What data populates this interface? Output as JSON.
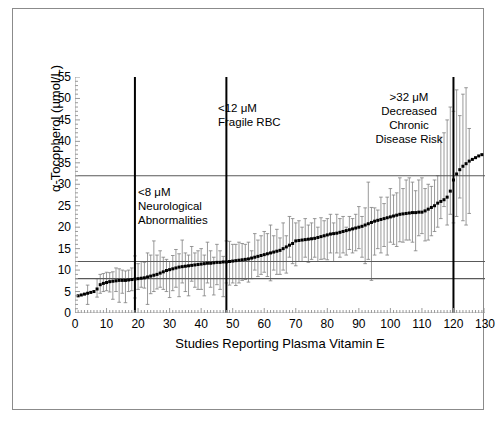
{
  "figure": {
    "caption": "",
    "background": "#ffffff",
    "frame_color": "#8b8b8b"
  },
  "colors": {
    "marker": "#000000",
    "errorbar": "#808080",
    "reference_line": "#595959",
    "divider_line": "#000000",
    "axis": "#9a9a9a",
    "text": "#000000"
  },
  "annotations": [
    {
      "id": "neurological",
      "text": "<8 μM\nNeurological\nAbnormalities",
      "at_x": 19
    },
    {
      "id": "fragile-rbc",
      "text": "<12 μM\nFragile RBC",
      "at_x": 48
    },
    {
      "id": "chronic-disease",
      "text": ">32 μM\nDecreased\nChronic\nDisease Risk",
      "at_x": 120
    }
  ],
  "chart_data": {
    "type": "scatter",
    "title": "",
    "xlabel": "Studies Reporting Plasma Vitamin E",
    "ylabel": "α-Tocopherol (μmol/L)",
    "xlim": [
      0,
      130
    ],
    "ylim": [
      0,
      55
    ],
    "xticks": [
      0,
      10,
      20,
      30,
      40,
      50,
      60,
      70,
      80,
      90,
      100,
      110,
      120,
      130
    ],
    "yticks": [
      0,
      5,
      10,
      15,
      20,
      25,
      30,
      35,
      40,
      45,
      50,
      55
    ],
    "grid": false,
    "legend": "none",
    "marker_style": "filled-square-with-error-bars",
    "reference_lines_y": [
      8,
      12,
      32
    ],
    "divider_lines_x": [
      19,
      48,
      120
    ],
    "x": [
      1,
      2,
      3,
      4,
      5,
      6,
      7,
      8,
      9,
      10,
      11,
      12,
      13,
      14,
      15,
      16,
      17,
      18,
      19,
      20,
      21,
      22,
      23,
      24,
      25,
      26,
      27,
      28,
      29,
      30,
      31,
      32,
      33,
      34,
      35,
      36,
      37,
      38,
      39,
      40,
      41,
      42,
      43,
      44,
      45,
      46,
      47,
      48,
      49,
      50,
      51,
      52,
      53,
      54,
      55,
      56,
      57,
      58,
      59,
      60,
      61,
      62,
      63,
      64,
      65,
      66,
      67,
      68,
      69,
      70,
      71,
      72,
      73,
      74,
      75,
      76,
      77,
      78,
      79,
      80,
      81,
      82,
      83,
      84,
      85,
      86,
      87,
      88,
      89,
      90,
      91,
      92,
      93,
      94,
      95,
      96,
      97,
      98,
      99,
      100,
      101,
      102,
      103,
      104,
      105,
      106,
      107,
      108,
      109,
      110,
      111,
      112,
      113,
      114,
      115,
      116,
      117,
      118,
      119,
      120,
      121,
      122,
      123,
      124,
      125,
      126,
      127,
      128,
      129
    ],
    "y": [
      4.0,
      4.2,
      4.4,
      4.6,
      4.8,
      5.0,
      5.6,
      6.6,
      6.9,
      7.1,
      7.3,
      7.4,
      7.5,
      7.6,
      7.6,
      7.6,
      7.7,
      7.8,
      7.9,
      8.0,
      8.1,
      8.2,
      8.4,
      8.6,
      8.8,
      9.0,
      9.3,
      9.6,
      9.9,
      10.1,
      10.3,
      10.5,
      10.7,
      10.8,
      10.9,
      11.0,
      11.1,
      11.2,
      11.3,
      11.4,
      11.5,
      11.6,
      11.6,
      11.7,
      11.8,
      11.8,
      11.9,
      11.9,
      12.0,
      12.1,
      12.2,
      12.3,
      12.4,
      12.5,
      12.6,
      12.8,
      13.0,
      13.2,
      13.4,
      13.6,
      13.8,
      14.0,
      14.2,
      14.4,
      14.6,
      15.0,
      15.4,
      15.8,
      16.2,
      16.8,
      16.9,
      17.0,
      17.1,
      17.2,
      17.3,
      17.4,
      17.6,
      17.8,
      18.0,
      18.2,
      18.4,
      18.5,
      18.6,
      18.8,
      19.0,
      19.2,
      19.4,
      19.6,
      19.8,
      20.0,
      20.2,
      20.5,
      20.8,
      21.1,
      21.4,
      21.6,
      21.8,
      22.0,
      22.2,
      22.4,
      22.6,
      22.8,
      23.0,
      23.1,
      23.2,
      23.3,
      23.4,
      23.4,
      23.5,
      23.5,
      23.8,
      24.2,
      24.6,
      25.0,
      25.6,
      26.0,
      26.4,
      27.0,
      28.4,
      31.0,
      32.4,
      33.4,
      34.2,
      34.8,
      35.4,
      35.8,
      36.2,
      36.6,
      36.9
    ],
    "y_err_low": [
      null,
      null,
      null,
      2.0,
      null,
      null,
      3.7,
      4.6,
      5.0,
      5.2,
      4.9,
      3.2,
      5.0,
      2.5,
      4.6,
      2.4,
      5.0,
      5.2,
      3.5,
      5.5,
      6.0,
      5.8,
      2.0,
      4.5,
      5.0,
      5.6,
      6.0,
      5.5,
      5.0,
      3.6,
      5.2,
      6.0,
      3.8,
      7.0,
      5.0,
      4.0,
      7.4,
      6.0,
      5.5,
      5.5,
      4.0,
      7.0,
      6.0,
      4.2,
      6.6,
      5.5,
      3.8,
      7.0,
      6.5,
      7.0,
      6.4,
      7.0,
      7.6,
      7.8,
      7.2,
      8.0,
      10.0,
      8.5,
      9.0,
      9.5,
      8.5,
      7.5,
      10.0,
      9.0,
      9.0,
      10.0,
      9.3,
      13.0,
      11.5,
      11.0,
      12.0,
      12.0,
      13.0,
      11.8,
      12.5,
      13.0,
      12.0,
      12.5,
      12.6,
      12.4,
      14.0,
      12.0,
      14.0,
      13.0,
      14.0,
      13.5,
      14.8,
      14.0,
      14.5,
      15.0,
      13.0,
      11.5,
      12.5,
      7.6,
      13.5,
      15.0,
      14.0,
      15.5,
      13.5,
      16.5,
      16.0,
      15.5,
      16.6,
      16.5,
      17.0,
      17.0,
      16.5,
      14.5,
      18.0,
      18.5,
      16.8,
      17.0,
      18.0,
      19.0,
      20.0,
      22.0,
      24.8,
      20.5,
      23.0,
      21.0,
      22.5,
      26.8,
      21.5,
      20.5,
      23.2
    ],
    "y_err_high": [
      null,
      null,
      null,
      6.5,
      null,
      null,
      8.0,
      9.0,
      9.2,
      9.5,
      9.4,
      9.6,
      10.5,
      10.3,
      10.0,
      9.8,
      10.0,
      10.5,
      13.3,
      11.5,
      12.0,
      11.8,
      14.0,
      13.5,
      16.8,
      13.5,
      14.5,
      13.0,
      12.5,
      12.0,
      13.4,
      14.8,
      13.8,
      17.0,
      14.0,
      13.5,
      15.5,
      14.0,
      14.5,
      15.0,
      13.5,
      16.5,
      14.5,
      13.0,
      16.0,
      14.5,
      13.2,
      16.8,
      16.7,
      16.0,
      16.0,
      16.5,
      16.2,
      16.0,
      16.5,
      14.5,
      18.5,
      17.0,
      18.0,
      19.0,
      18.5,
      20.5,
      18.0,
      19.5,
      17.5,
      21.0,
      18.0,
      22.5,
      22.0,
      21.0,
      21.5,
      20.0,
      22.0,
      20.5,
      21.0,
      22.0,
      20.0,
      22.2,
      21.5,
      22.0,
      23.0,
      21.0,
      23.0,
      22.0,
      22.5,
      20.0,
      22.5,
      22.0,
      23.0,
      24.8,
      22.5,
      24.5,
      30.5,
      24.6,
      24.5,
      24.0,
      27.0,
      25.5,
      27.0,
      29.0,
      27.5,
      28.0,
      31.5,
      29.0,
      31.0,
      31.5,
      30.5,
      28.5,
      31.0,
      31.5,
      29.0,
      30.0,
      29.5,
      31.0,
      32.0,
      41.0,
      42.0,
      45.0,
      48.0,
      47.0,
      52.0,
      46.0,
      51.0,
      52.5,
      43.0
    ]
  }
}
